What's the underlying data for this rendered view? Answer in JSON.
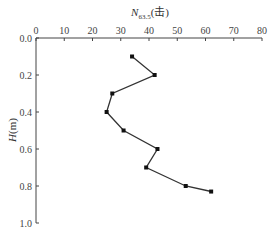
{
  "chart_data": {
    "type": "line",
    "title": "",
    "xlabel": "N63.5(击)",
    "xlabel_main": "N",
    "xlabel_sub": "63.5",
    "xlabel_suffix": "(击)",
    "ylabel": "H(m)",
    "ylabel_main": "H",
    "ylabel_suffix": "(m)",
    "x_axis_position": "top",
    "y_axis_inverted": true,
    "xlim": [
      0,
      80
    ],
    "ylim": [
      0.0,
      1.0
    ],
    "x_ticks": [
      "0",
      "10",
      "20",
      "30",
      "40",
      "50",
      "60",
      "70",
      "80"
    ],
    "y_ticks": [
      "0.0",
      "0.2",
      "0.4",
      "0.6",
      "0.8",
      "1.0"
    ],
    "grid": false,
    "legend": null,
    "marker": "square",
    "line_color": "#333333",
    "series": [
      {
        "name": "N63.5",
        "points": [
          {
            "x": 34,
            "y": 0.1
          },
          {
            "x": 42,
            "y": 0.2
          },
          {
            "x": 27,
            "y": 0.3
          },
          {
            "x": 25,
            "y": 0.4
          },
          {
            "x": 31,
            "y": 0.5
          },
          {
            "x": 43,
            "y": 0.6
          },
          {
            "x": 39,
            "y": 0.7
          },
          {
            "x": 53,
            "y": 0.8
          },
          {
            "x": 62,
            "y": 0.83
          }
        ]
      }
    ]
  }
}
